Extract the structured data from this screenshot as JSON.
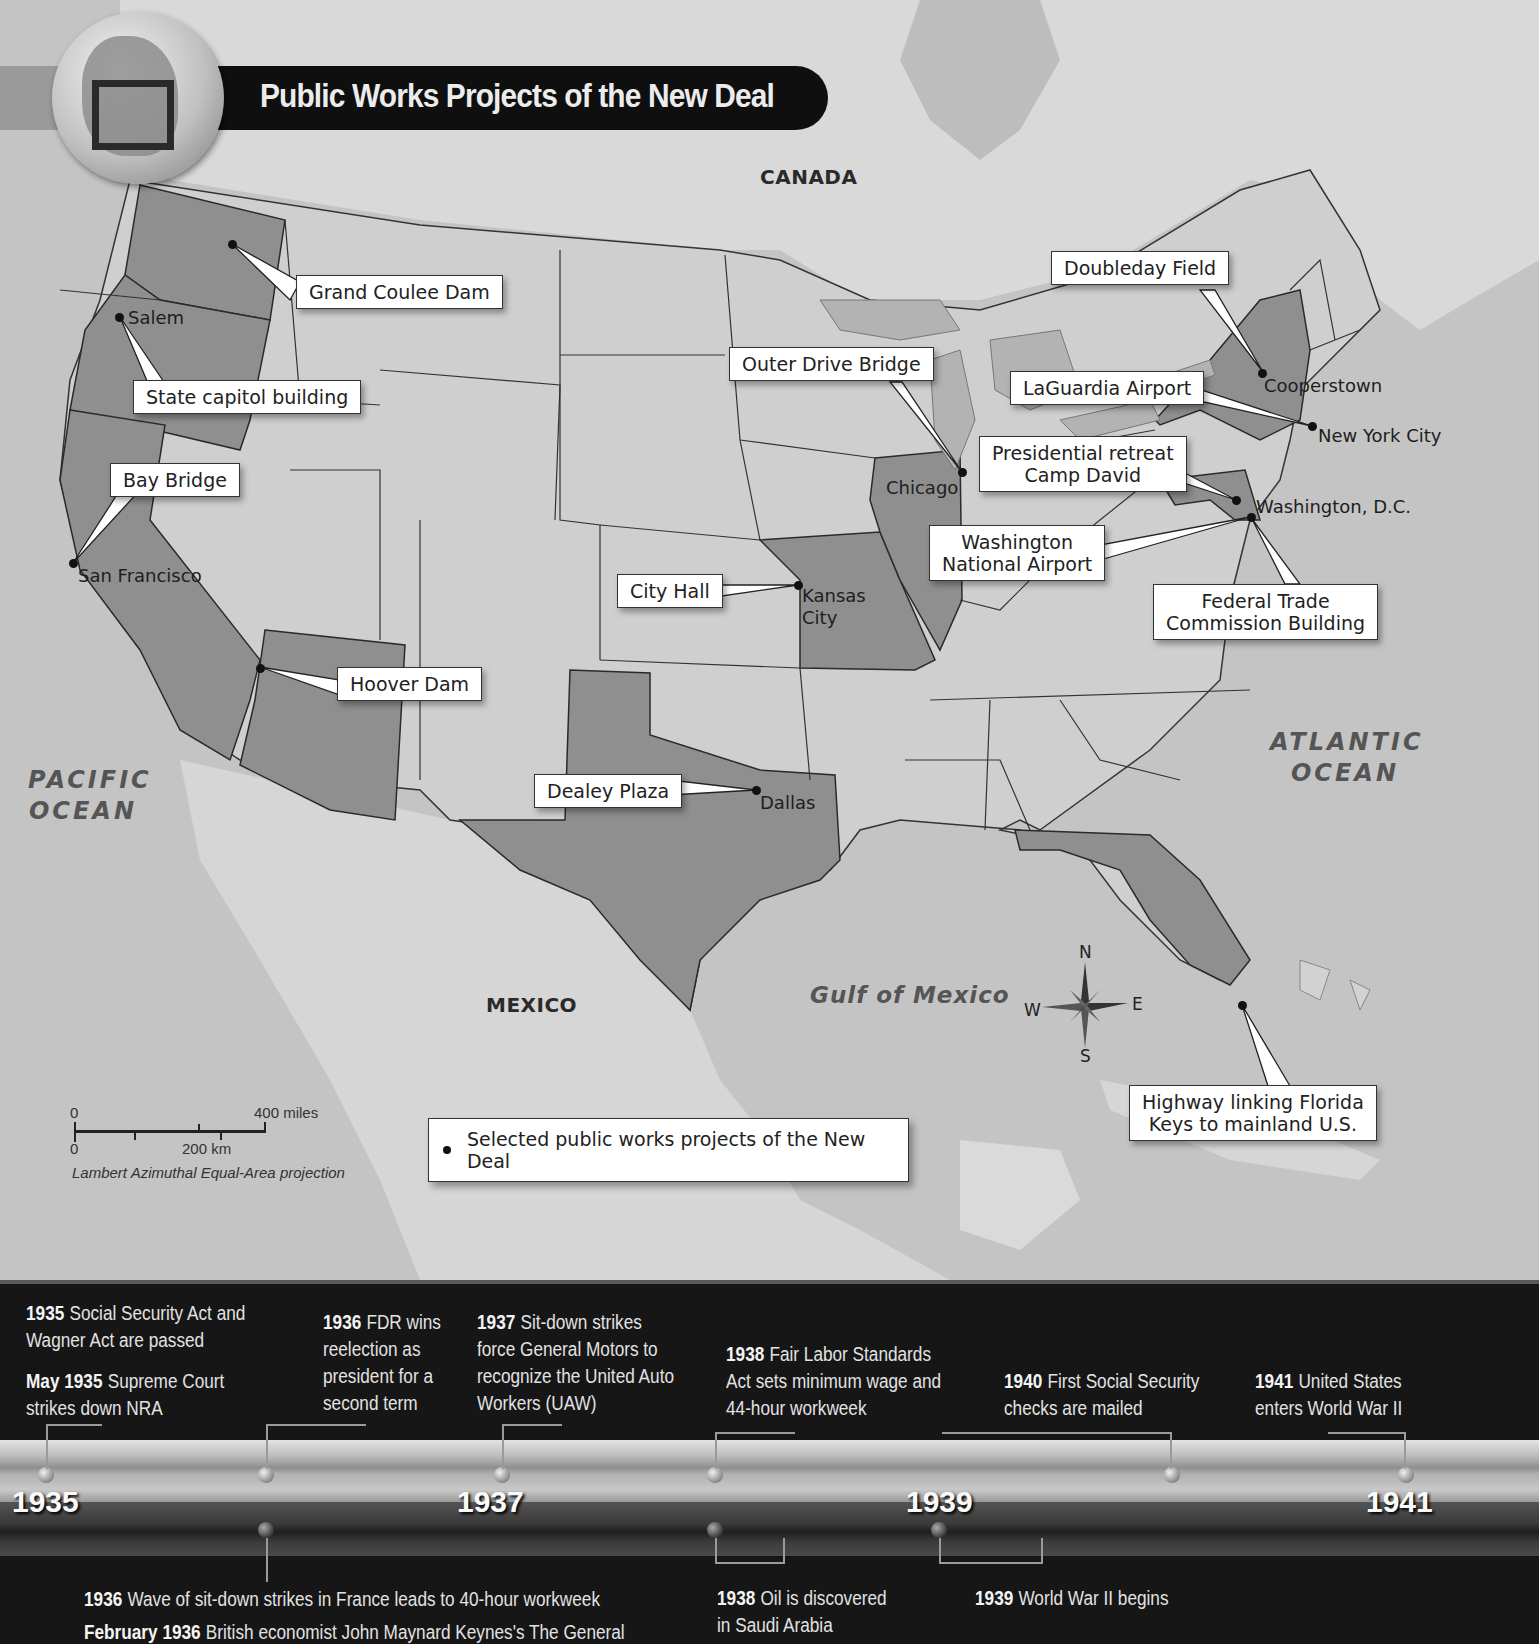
{
  "map": {
    "title": "Public Works Projects of the New Deal",
    "regions": {
      "canada": "CANADA",
      "mexico": "MEXICO",
      "pacific": [
        "PACIFIC",
        "OCEAN"
      ],
      "atlantic": [
        "ATLANTIC",
        "OCEAN"
      ],
      "gulf": "Gulf of Mexico"
    },
    "projects": [
      {
        "label": "Grand Coulee Dam",
        "city": ""
      },
      {
        "label": "State capitol building",
        "city": "Salem"
      },
      {
        "label": "Bay Bridge",
        "city": "San Francisco"
      },
      {
        "label": "Hoover Dam",
        "city": ""
      },
      {
        "label": "City Hall",
        "city": "Kansas City"
      },
      {
        "label": "Dealey Plaza",
        "city": "Dallas"
      },
      {
        "label": "Outer Drive Bridge",
        "city": "Chicago"
      },
      {
        "label": "Doubleday Field",
        "city": "Cooperstown"
      },
      {
        "label": "LaGuardia Airport",
        "city": "New York City"
      },
      {
        "label": "Presidential retreat Camp David",
        "line1": "Presidential retreat",
        "line2": "Camp David",
        "city": ""
      },
      {
        "label": "Washington National Airport",
        "line1": "Washington",
        "line2": "National Airport",
        "city": "Washington, D.C."
      },
      {
        "label": "Federal Trade Commission Building",
        "line1": "Federal Trade",
        "line2": "Commission Building",
        "city": ""
      },
      {
        "label": "Highway linking Florida Keys to mainland U.S.",
        "line1": "Highway linking Florida",
        "line2": "Keys to mainland U.S.",
        "city": ""
      }
    ],
    "cities": {
      "salem": "Salem",
      "sf": "San Francisco",
      "kc1": "Kansas",
      "kc2": "City",
      "dallas": "Dallas",
      "chicago": "Chicago",
      "cooperstown": "Cooperstown",
      "nyc": "New York City",
      "dc": "Washington, D.C."
    },
    "compass": {
      "n": "N",
      "s": "S",
      "e": "E",
      "w": "W"
    },
    "scale": {
      "zero_top": "0",
      "miles": "400 miles",
      "zero_bottom": "0",
      "km": "200 km",
      "projection": "Lambert Azimuthal Equal-Area projection"
    },
    "legend": {
      "label": "Selected public works projects of the New Deal"
    }
  },
  "timeline": {
    "years": [
      "1935",
      "1937",
      "1939",
      "1941"
    ],
    "above": [
      {
        "date": "1935",
        "text": [
          "Social Security Act and",
          "Wagner Act are passed"
        ]
      },
      {
        "date": "May 1935",
        "text": [
          "Supreme Court",
          "strikes down NRA"
        ]
      },
      {
        "date": "1936",
        "text": [
          "FDR wins",
          "reelection as",
          "president for a",
          "second term"
        ]
      },
      {
        "date": "1937",
        "text": [
          "Sit-down strikes",
          "force General Motors to",
          "recognize the United Auto",
          "Workers (UAW)"
        ]
      },
      {
        "date": "1938",
        "text": [
          "Fair Labor Standards",
          "Act sets minimum wage and",
          "44-hour workweek"
        ]
      },
      {
        "date": "1940",
        "text": [
          "First Social Security",
          "checks are mailed"
        ]
      },
      {
        "date": "1941",
        "text": [
          "United States",
          "enters World War II"
        ]
      }
    ],
    "below": [
      {
        "date": "1936",
        "text": [
          "Wave of sit-down strikes in France leads to 40-hour workweek"
        ]
      },
      {
        "date": "February 1936",
        "text": [
          "British economist John Maynard Keynes's The General"
        ]
      },
      {
        "date": "1938",
        "text": [
          "Oil is discovered",
          "in Saudi Arabia"
        ]
      },
      {
        "date": "1939",
        "text": [
          "World War II begins"
        ]
      }
    ]
  }
}
